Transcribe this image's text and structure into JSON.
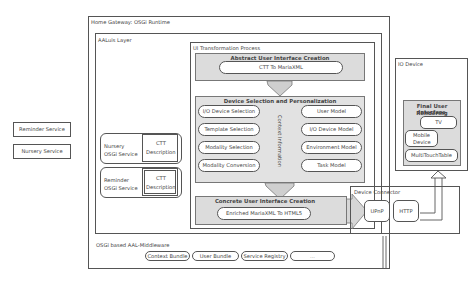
{
  "external_services": [
    {
      "label": "Reminder Service"
    },
    {
      "label": "Nursery Service"
    }
  ],
  "home_gateway": {
    "title": "Home Gateway: OSGi Runtime",
    "aaluis_layer": {
      "title": "AALuis Layer",
      "osgi_services": [
        {
          "name": "Nursery OSGi Service",
          "name_line1": "Nursery",
          "name_line2": "OSGi Service",
          "ctt_line1": "CTT",
          "ctt_line2": "Description"
        },
        {
          "name": "Reminder OSGi Service",
          "name_line1": "Reminder",
          "name_line2": "OSGi Service",
          "ctt_line1": "CTT",
          "ctt_line2": "Description"
        }
      ],
      "ui_transformation": {
        "title": "UI Transformation Process",
        "abstract": {
          "title": "Abstract User Interface Creation",
          "step": "CTT To MariaXML"
        },
        "device_selection": {
          "title": "Device Selection and Personalization",
          "left_steps": [
            "I/O Device Selection",
            "Template Selection",
            "Modality Selection",
            "Modality Conversion"
          ],
          "context_label": "Context Information",
          "right_models": [
            "User Model",
            "I/O Device Model",
            "Environment Model",
            "Task Model"
          ]
        },
        "concrete": {
          "title": "Concrete User Interface Creation",
          "step": "Enriched MariaXML To HTML5"
        }
      }
    },
    "device_connector": {
      "title": "Device Connector",
      "protocols": [
        "UPnP",
        "HTTP"
      ]
    },
    "middleware": {
      "title": "OSGi based AAL-Middleware",
      "bundles": [
        "Context Bundle",
        "User Bundle",
        "Service Registry",
        "..."
      ]
    }
  },
  "io_device": {
    "title": "IO Device",
    "rendering_title_line1": "Final User Interface",
    "rendering_title_line2": "Rendering",
    "devices": [
      {
        "label": "TV"
      },
      {
        "label_line1": "Mobile",
        "label_line2": "Device"
      },
      {
        "label": "MultiTouchTable"
      }
    ]
  },
  "colors": {
    "border": "#555555",
    "gray_fill": "#dcdcdc",
    "arrow_fill": "#cfcfcf"
  }
}
